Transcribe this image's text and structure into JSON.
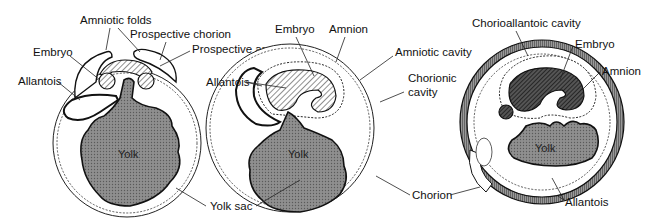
{
  "figure": {
    "panels": [
      {
        "id": "stage-1",
        "labels": {
          "amniotic_folds": "Amniotic folds",
          "prospective_chorion": "Prospective chorion",
          "prospective_amnion": "Prospective amnion",
          "embryo": "Embryo",
          "allantois": "Allantois",
          "yolk": "Yolk"
        }
      },
      {
        "id": "stage-2",
        "labels": {
          "embryo": "Embryo",
          "amnion": "Amnion",
          "amniotic_cavity": "Amniotic cavity",
          "allantois": "Allantois",
          "chorionic_cavity_line1": "Chorionic",
          "chorionic_cavity_line2": "cavity",
          "yolk": "Yolk"
        }
      },
      {
        "id": "stage-3",
        "labels": {
          "chorioallantoic_cavity": "Chorioallantoic cavity",
          "embryo": "Embryo",
          "amnion": "Amnion",
          "yolk": "Yolk",
          "allantois": "Allantois"
        }
      }
    ],
    "shared_labels": {
      "yolk_sac": "Yolk sac",
      "chorion": "Chorion"
    }
  }
}
